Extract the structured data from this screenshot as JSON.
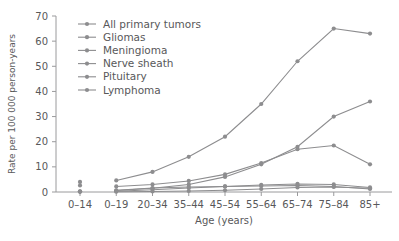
{
  "chart_data": {
    "type": "line",
    "title": "",
    "xlabel": "Age (years)",
    "ylabel": "Rate per 100 000 person-years",
    "categories": [
      "0–14",
      "0–19",
      "20–34",
      "35–44",
      "45–54",
      "55–64",
      "65–74",
      "75–84",
      "85+"
    ],
    "yticks": [
      0,
      10,
      20,
      30,
      40,
      50,
      60,
      70
    ],
    "ylim": [
      0,
      70
    ],
    "grid": false,
    "legend_position": "top-left-inside",
    "note": "The 0–14 column is a disconnected cluster of single points; the connected lines start at 0–19.",
    "series": [
      {
        "name": "All primary tumors",
        "color": "#8d8d8f",
        "values": [
          4.0,
          4.6,
          8.0,
          14.0,
          22.0,
          35.0,
          52.0,
          65.0,
          63.0
        ]
      },
      {
        "name": "Gliomas",
        "color": "#8d8d8f",
        "values": [
          2.6,
          2.2,
          3.0,
          4.4,
          7.0,
          11.5,
          17.0,
          18.5,
          11.0
        ]
      },
      {
        "name": "Meningioma",
        "color": "#8d8d8f",
        "values": [
          0.3,
          0.6,
          1.5,
          3.0,
          6.0,
          11.0,
          18.0,
          30.0,
          36.0
        ]
      },
      {
        "name": "Nerve sheath",
        "color": "#8d8d8f",
        "values": [
          0.15,
          0.3,
          0.9,
          1.6,
          2.2,
          2.8,
          3.2,
          3.0,
          1.8
        ]
      },
      {
        "name": "Pituitary",
        "color": "#8d8d8f",
        "values": [
          0.2,
          0.7,
          1.6,
          2.0,
          2.2,
          2.4,
          2.6,
          2.2,
          1.2
        ]
      },
      {
        "name": "Lymphoma",
        "color": "#8d8d8f",
        "values": [
          0.05,
          0.1,
          0.2,
          0.4,
          0.7,
          1.2,
          1.8,
          2.0,
          1.5
        ]
      }
    ]
  },
  "axis": {
    "ylabel": "Rate per 100 000 person-years",
    "xlabel": "Age (years)",
    "ytick_labels": [
      "0",
      "10",
      "20",
      "30",
      "40",
      "50",
      "60",
      "70"
    ],
    "xtick_labels": [
      "0–14",
      "0–19",
      "20–34",
      "35–44",
      "45–54",
      "55–64",
      "65–74",
      "75–84",
      "85+"
    ]
  },
  "legend": {
    "items": [
      {
        "label": "All primary tumors"
      },
      {
        "label": "Gliomas"
      },
      {
        "label": "Meningioma"
      },
      {
        "label": "Nerve sheath"
      },
      {
        "label": "Pituitary"
      },
      {
        "label": "Lymphoma"
      }
    ]
  }
}
